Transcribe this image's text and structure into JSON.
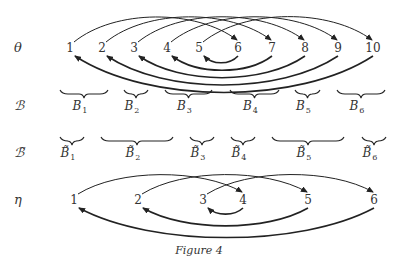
{
  "rows": {
    "theta": {
      "label": "θ",
      "y": 48,
      "nodes": [
        {
          "label": "1",
          "x": 70
        },
        {
          "label": "2",
          "x": 102
        },
        {
          "label": "3",
          "x": 134
        },
        {
          "label": "4",
          "x": 167
        },
        {
          "label": "5",
          "x": 199
        },
        {
          "label": "6",
          "x": 238
        },
        {
          "label": "7",
          "x": 272
        },
        {
          "label": "8",
          "x": 305
        },
        {
          "label": "9",
          "x": 338
        },
        {
          "label": "10",
          "x": 373
        }
      ],
      "top_arcs": [
        [
          "1",
          "6"
        ],
        [
          "2",
          "7"
        ],
        [
          "3",
          "8"
        ],
        [
          "4",
          "9"
        ],
        [
          "5",
          "10"
        ]
      ],
      "bottom_arcs": [
        [
          "10",
          "1"
        ],
        [
          "9",
          "2"
        ],
        [
          "8",
          "3"
        ],
        [
          "7",
          "4"
        ],
        [
          "6",
          "5"
        ]
      ]
    },
    "B": {
      "label": "ℬ",
      "y": 100,
      "blocks": [
        {
          "name": "B",
          "sub": "1",
          "x1": 60,
          "x2": 108
        },
        {
          "name": "B",
          "sub": "2",
          "x1": 124,
          "x2": 148
        },
        {
          "name": "B",
          "sub": "3",
          "x1": 165,
          "x2": 212
        },
        {
          "name": "B",
          "sub": "4",
          "x1": 230,
          "x2": 279
        },
        {
          "name": "B",
          "sub": "5",
          "x1": 295,
          "x2": 320
        },
        {
          "name": "B",
          "sub": "6",
          "x1": 337,
          "x2": 385
        }
      ]
    },
    "Btilde": {
      "label": "ℬ̃",
      "y": 147,
      "blocks": [
        {
          "name": "B̃",
          "sub": "1",
          "x1": 60,
          "x2": 84
        },
        {
          "name": "B̃",
          "sub": "2",
          "x1": 101,
          "x2": 173
        },
        {
          "name": "B̃",
          "sub": "3",
          "x1": 190,
          "x2": 214
        },
        {
          "name": "B̃",
          "sub": "4",
          "x1": 231,
          "x2": 255
        },
        {
          "name": "B̃",
          "sub": "5",
          "x1": 272,
          "x2": 344
        },
        {
          "name": "B̃",
          "sub": "6",
          "x1": 362,
          "x2": 386
        }
      ]
    },
    "eta": {
      "label": "η",
      "y": 200,
      "nodes": [
        {
          "label": "1",
          "x": 74
        },
        {
          "label": "2",
          "x": 138
        },
        {
          "label": "3",
          "x": 203
        },
        {
          "label": "4",
          "x": 243
        },
        {
          "label": "5",
          "x": 308
        },
        {
          "label": "6",
          "x": 374
        }
      ],
      "top_arcs": [
        [
          "1",
          "4"
        ],
        [
          "2",
          "5"
        ],
        [
          "3",
          "6"
        ]
      ],
      "bottom_arcs": [
        [
          "6",
          "1"
        ],
        [
          "5",
          "2"
        ],
        [
          "4",
          "3"
        ]
      ]
    }
  },
  "caption": "Figure 4"
}
